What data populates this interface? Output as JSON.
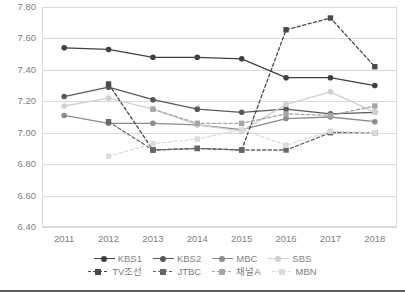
{
  "chart_data": {
    "type": "line",
    "title": "",
    "subtitle": "",
    "xlabel": "",
    "ylabel": "",
    "categories": [
      "2011",
      "2012",
      "2013",
      "2014",
      "2015",
      "2016",
      "2017",
      "2018"
    ],
    "x": [
      2011,
      2012,
      2013,
      2014,
      2015,
      2016,
      2017,
      2018
    ],
    "ylim": [
      6.4,
      7.8
    ],
    "ytick_step": 0.2,
    "ytick_labels": [
      "7.80",
      "7.60",
      "7.40",
      "7.20",
      "7.00",
      "6.80",
      "6.60",
      "6.40"
    ],
    "ytick_values": [
      7.8,
      7.6,
      7.4,
      7.2,
      7.0,
      6.8,
      6.6,
      6.4
    ],
    "xtick_labels": [
      "2011",
      "2012",
      "2013",
      "2014",
      "2015",
      "2016",
      "2017",
      "2018"
    ],
    "grid": "horizontal",
    "legend_position": "bottom",
    "series": [
      {
        "name": "KBS1",
        "color": "#404040",
        "style": "solid",
        "marker": "circle",
        "values": [
          7.54,
          7.53,
          7.48,
          7.48,
          7.47,
          7.35,
          7.35,
          7.3
        ]
      },
      {
        "name": "KBS2",
        "color": "#595959",
        "style": "solid",
        "marker": "circle",
        "values": [
          7.23,
          7.29,
          7.21,
          7.15,
          7.13,
          7.15,
          7.12,
          7.13
        ]
      },
      {
        "name": "MBC",
        "color": "#8c8c8c",
        "style": "solid",
        "marker": "circle",
        "values": [
          7.11,
          7.06,
          7.06,
          7.05,
          7.02,
          7.09,
          7.1,
          7.07
        ]
      },
      {
        "name": "SBS",
        "color": "#d0d0d0",
        "style": "solid",
        "marker": "circle",
        "values": [
          7.17,
          7.22,
          7.15,
          7.05,
          7.01,
          7.18,
          7.26,
          7.13
        ]
      },
      {
        "name": "TV조선",
        "color": "#4a4a4a",
        "style": "dashed",
        "marker": "square",
        "values": [
          null,
          7.31,
          6.89,
          6.9,
          6.89,
          7.655,
          7.73,
          7.42
        ]
      },
      {
        "name": "JTBC",
        "color": "#666666",
        "style": "dashed",
        "marker": "square",
        "values": [
          null,
          7.07,
          6.89,
          6.9,
          6.89,
          6.89,
          7.0,
          7.0
        ]
      },
      {
        "name": "채널A",
        "color": "#a6a6a6",
        "style": "dashed",
        "marker": "square",
        "values": [
          null,
          null,
          7.15,
          7.06,
          7.06,
          7.12,
          7.11,
          7.17
        ]
      },
      {
        "name": "MBN",
        "color": "#dcdcdc",
        "style": "dashed",
        "marker": "square",
        "values": [
          null,
          6.85,
          6.93,
          6.96,
          7.02,
          6.92,
          7.01,
          7.0
        ]
      }
    ]
  },
  "legend": {
    "row1": [
      "KBS1",
      "KBS2",
      "MBC",
      "SBS"
    ],
    "row2": [
      "TV조선",
      "JTBC",
      "채널A",
      "MBN"
    ]
  },
  "colors": {
    "grid": "#d9d9d9",
    "axis_text": "#808080",
    "background": "#ffffff",
    "bottom_rule": "#5f5f5f"
  }
}
